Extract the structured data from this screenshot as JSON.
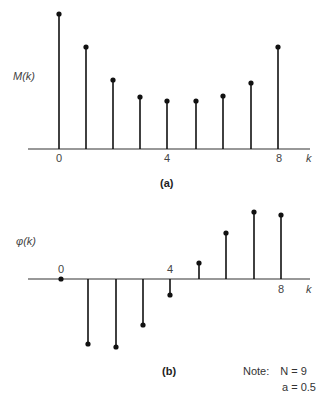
{
  "chart_data": [
    {
      "type": "stem",
      "panel": "(a)",
      "ylabel": "M(k)",
      "xlabel": "k",
      "x_tick_labels": [
        "0",
        "4",
        "8"
      ],
      "x": [
        0,
        1,
        2,
        3,
        4,
        5,
        6,
        7,
        8
      ],
      "values": [
        2.0,
        1.51,
        1.03,
        0.78,
        0.72,
        0.72,
        0.79,
        0.99,
        1.51
      ],
      "axis_y": 149,
      "px_x": [
        59,
        86,
        113,
        140,
        167,
        196,
        223,
        251,
        278
      ],
      "px_y": [
        14,
        47,
        80,
        97,
        101,
        101,
        96,
        83,
        47
      ]
    },
    {
      "type": "stem",
      "panel": "(b)",
      "ylabel": "φ(k)",
      "xlabel": "k",
      "x_tick_labels": [
        "0",
        "4",
        "8"
      ],
      "x": [
        0,
        1,
        2,
        3,
        4,
        5,
        6,
        7,
        8
      ],
      "values": [
        0,
        -0.56,
        -0.58,
        -0.39,
        -0.14,
        0.14,
        0.39,
        0.58,
        0.56
      ],
      "axis_y": 279,
      "px_x": [
        61,
        88,
        116,
        143,
        170,
        199,
        226,
        254,
        281
      ],
      "px_y": [
        279,
        344,
        347,
        325,
        295,
        263,
        233,
        212,
        215
      ]
    }
  ],
  "panel_a": {
    "ylabel": "M(k)",
    "xlabel": "k",
    "ticks": [
      "0",
      "4",
      "8"
    ],
    "caption": "(a)"
  },
  "panel_b": {
    "ylabel": "φ(k)",
    "xlabel": "k",
    "ticks": [
      "0",
      "4",
      "8"
    ],
    "caption": "(b)"
  },
  "note": {
    "label": "Note:",
    "line1": "N = 9",
    "line2": "a = 0.5"
  }
}
